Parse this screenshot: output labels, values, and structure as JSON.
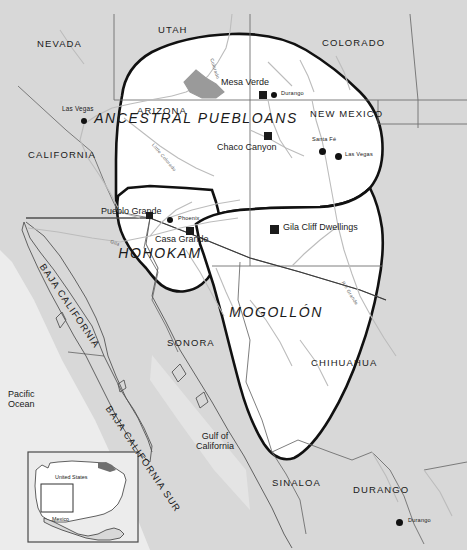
{
  "map": {
    "title": "Ancestral cultures of the American Southwest",
    "colors": {
      "land": "#d8d8d8",
      "culture_area_fill": "#ffffff",
      "culture_boundary": "#111111",
      "state_border": "#6f6f6f",
      "country_border": "#3a3a3a",
      "river": "#b9b9b9",
      "lake": "#9a9a9a",
      "marker": "#161616",
      "text": "#1a1a1a"
    },
    "culture_areas": [
      {
        "name": "ANCESTRAL PUEBLOANS",
        "x": 196,
        "y": 118
      },
      {
        "name": "HOHOKAM",
        "x": 160,
        "y": 253
      },
      {
        "name": "MOGOLLÓN",
        "x": 276,
        "y": 312
      }
    ],
    "states": [
      {
        "name": "NEVADA",
        "x": 37,
        "y": 45
      },
      {
        "name": "UTAH",
        "x": 158,
        "y": 31
      },
      {
        "name": "COLORADO",
        "x": 322,
        "y": 44
      },
      {
        "name": "ARIZONA",
        "x": 137,
        "y": 112
      },
      {
        "name": "NEW MEXICO",
        "x": 310,
        "y": 115
      },
      {
        "name": "CALIFORNIA",
        "x": 28,
        "y": 156
      },
      {
        "name": "SONORA",
        "x": 167,
        "y": 344
      },
      {
        "name": "CHIHUAHUA",
        "x": 311,
        "y": 364
      },
      {
        "name": "SINALOA",
        "x": 272,
        "y": 484
      },
      {
        "name": "DURANGO",
        "x": 353,
        "y": 491
      }
    ],
    "rotated_states": [
      {
        "name": "BAJA CALIFORNIA",
        "x": 46,
        "y": 262,
        "rotate": 56
      },
      {
        "name": "BAJA CALIFORNIA SUR",
        "x": 112,
        "y": 404,
        "rotate": 56
      }
    ],
    "archaeological_sites": [
      {
        "name": "Mesa Verde",
        "label_x": 221,
        "label_y": 85,
        "marker_x": 259,
        "marker_y": 95
      },
      {
        "name": "Chaco Canyon",
        "label_x": 217,
        "label_y": 148,
        "marker_x": 264,
        "marker_y": 136
      },
      {
        "name": "Pueblo Grande",
        "label_x": 101,
        "label_y": 212,
        "marker_x": 146,
        "marker_y": 216
      },
      {
        "name": "Casa Grande",
        "label_x": 155,
        "label_y": 240,
        "marker_x": 186,
        "marker_y": 231
      },
      {
        "name": "Gila Cliff Dwellings",
        "label_x": 283,
        "label_y": 228,
        "marker_x": 270,
        "marker_y": 229
      }
    ],
    "cities": [
      {
        "name": "Las Vegas",
        "label_x": 62,
        "label_y": 111,
        "marker_x": 84,
        "marker_y": 121,
        "size": "small"
      },
      {
        "name": "Durango",
        "label_x": 281,
        "label_y": 94,
        "marker_x": 272,
        "marker_y": 95,
        "size": "small"
      },
      {
        "name": "Santa Fé",
        "label_x": 315,
        "label_y": 142,
        "marker_x": 322,
        "marker_y": 152,
        "size": "small"
      },
      {
        "name": "Las Vegas",
        "label_x": 345,
        "label_y": 155,
        "marker_x": 338,
        "marker_y": 157,
        "size": "small"
      },
      {
        "name": "Phoenix",
        "label_x": 178,
        "label_y": 220,
        "marker_x": 168,
        "marker_y": 222,
        "size": "small"
      },
      {
        "name": "Durango",
        "label_x": 408,
        "label_y": 521,
        "marker_x": 398,
        "marker_y": 523,
        "size": "small"
      }
    ],
    "water_labels": [
      {
        "name": "Pacific\nOcean",
        "x": 8,
        "y": 395
      },
      {
        "name": "Gulf of\nCalifornia",
        "x": 196,
        "y": 437
      }
    ],
    "rivers": [
      {
        "name": "Colorado",
        "x": 213,
        "y": 58,
        "rotate": 72
      },
      {
        "name": "Little Colorado",
        "x": 154,
        "y": 143,
        "rotate": 50
      },
      {
        "name": "Gila",
        "x": 111,
        "y": 240,
        "rotate": 20
      },
      {
        "name": "Rio Grande",
        "x": 344,
        "y": 281,
        "rotate": 58
      }
    ],
    "inset": {
      "labels": [
        {
          "name": "United States",
          "x": 55,
          "y": 478
        },
        {
          "name": "Mexico",
          "x": 52,
          "y": 520
        }
      ]
    }
  }
}
